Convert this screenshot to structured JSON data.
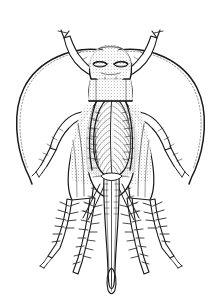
{
  "figure": {
    "style": "black-and-white stippled scientific line drawing",
    "background_color": "#ffffff",
    "ink_color": "#1a1a1a",
    "canvas": {
      "width": 221,
      "height": 306
    },
    "caption_text": ""
  },
  "anatomy": {
    "head": {
      "label": "head",
      "center_x": 110,
      "center_y": 64,
      "width": 40,
      "height": 36,
      "texture": "stipple",
      "eyes": [
        {
          "label": "left-compound-eye",
          "cx": 100,
          "cy": 66,
          "rx": 9,
          "ry": 4
        },
        {
          "label": "right-compound-eye",
          "cx": 120,
          "cy": 66,
          "rx": 9,
          "ry": 4
        }
      ],
      "ocelli_count": 2
    },
    "pronotum": {
      "label": "pronotum",
      "center_x": 110,
      "center_y": 88,
      "width": 40,
      "height": 22,
      "texture": "stipple"
    },
    "forewing": {
      "label": "forewing-tegmen",
      "center_x": 112,
      "center_y": 130,
      "width": 34,
      "height": 88,
      "venation": "fine parallel oblique veins",
      "vein_count": 26
    },
    "abdomen": {
      "label": "abdomen",
      "center_x": 110,
      "center_y": 160,
      "width": 42,
      "height": 70,
      "segment_count": 9
    },
    "ovipositor": {
      "label": "ovipositor",
      "top_y": 178,
      "tip_y": 292,
      "center_x": 111,
      "shaft_width": 5,
      "tip_shape": "lanceolate bulb"
    },
    "antennae": [
      {
        "label": "left-antenna",
        "side": "left",
        "origin": {
          "x": 100,
          "y": 48
        },
        "apex": {
          "x": 18,
          "y": 95
        },
        "tip": {
          "x": 30,
          "y": 183
        },
        "segmented": true
      },
      {
        "label": "right-antenna",
        "side": "right",
        "origin": {
          "x": 121,
          "y": 48
        },
        "apex": {
          "x": 203,
          "y": 95
        },
        "tip": {
          "x": 191,
          "y": 183
        },
        "segmented": true
      }
    ],
    "legs": [
      {
        "label": "left-foreleg",
        "side": "left",
        "pair": "fore",
        "spiny": false,
        "tarsus_visible": true
      },
      {
        "label": "right-foreleg",
        "side": "right",
        "pair": "fore",
        "spiny": false,
        "tarsus_visible": true
      },
      {
        "label": "left-midleg",
        "side": "left",
        "pair": "mid",
        "spiny": false,
        "tarsus_visible": true
      },
      {
        "label": "right-midleg",
        "side": "right",
        "pair": "mid",
        "spiny": false,
        "tarsus_visible": true
      },
      {
        "label": "left-hindleg",
        "side": "left",
        "pair": "hind",
        "spiny": true,
        "tarsus_visible": true,
        "femur_texture": "stipple"
      },
      {
        "label": "right-hindleg",
        "side": "right",
        "pair": "hind",
        "spiny": true,
        "tarsus_visible": true,
        "femur_texture": "stipple"
      }
    ],
    "cerci": [
      {
        "label": "left-cercus",
        "side": "left"
      },
      {
        "label": "right-cercus",
        "side": "right"
      }
    ]
  }
}
